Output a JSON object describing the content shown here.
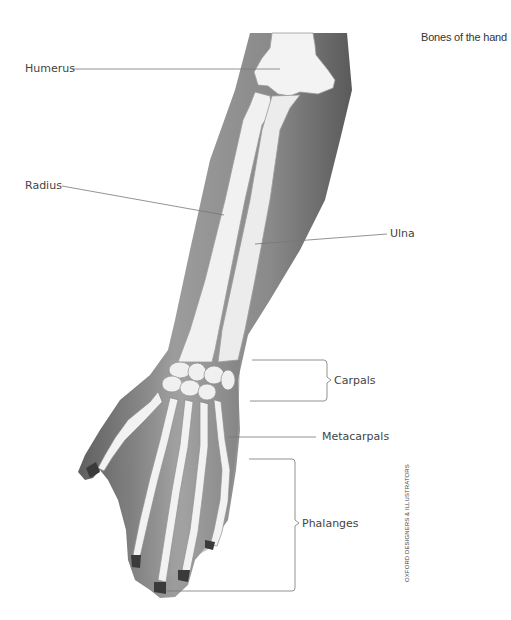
{
  "title": "Bones of the hand",
  "labels": {
    "humerus": "Humerus",
    "radius": "Radius",
    "ulna": "Ulna",
    "carpals": "Carpals",
    "metacarpals": "Metacarpals",
    "phalanges": "Phalanges"
  },
  "credit": "OXFORD DESIGNERS & ILLUSTRATORS",
  "colors": {
    "skin_dark": "#6b6b6b",
    "skin_mid": "#9a9a9a",
    "bone": "#f1f1f1",
    "bone_outline": "#8a8a8a",
    "leader_line": "#777777",
    "text": "#444444"
  }
}
